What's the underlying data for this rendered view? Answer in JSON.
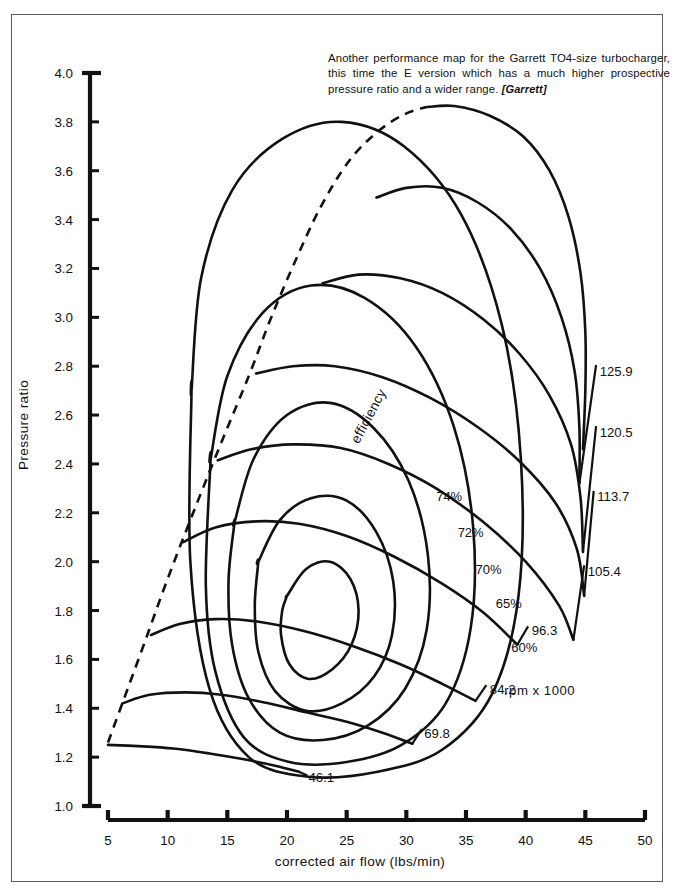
{
  "caption": {
    "text": "Another performance map for the Garrett TO4-size turbocharger, this time the E version which has a much higher prospective pressure ratio and a wider range.",
    "source": "[Garrett]"
  },
  "axes": {
    "y_title": "Pressure ratio",
    "x_title": "corrected  air  flow   (lbs/min)",
    "y_ticks": [
      "4.0",
      "3.8",
      "3.6",
      "3.4",
      "3.2",
      "3.0",
      "2.8",
      "2.6",
      "2.4",
      "2.2",
      "2.0",
      "1.8",
      "1.6",
      "1.4",
      "1.2",
      "1.0"
    ],
    "x_ticks": [
      "5",
      "10",
      "15",
      "20",
      "25",
      "30",
      "35",
      "40",
      "45",
      "50"
    ]
  },
  "notes": {
    "rpm_note": "rpm  x  1000",
    "efficiency_word": "efficiency"
  },
  "chart_data": {
    "type": "line",
    "xlabel": "corrected air flow (lbs/min)",
    "ylabel": "Pressure ratio",
    "xlim": [
      5,
      50
    ],
    "ylim": [
      1.0,
      4.0
    ],
    "xtick_values": [
      5,
      10,
      15,
      20,
      25,
      30,
      35,
      40,
      45,
      50
    ],
    "ytick_values": [
      1.0,
      1.2,
      1.4,
      1.6,
      1.8,
      2.0,
      2.2,
      2.4,
      2.6,
      2.8,
      3.0,
      3.2,
      3.4,
      3.6,
      3.8,
      4.0
    ],
    "grid": false,
    "legend": "none",
    "units": {
      "speed": "rpm x 1000",
      "flow": "lbs/min"
    },
    "surge_line": {
      "name": "surge line",
      "style": "dashed",
      "points": [
        [
          5.0,
          1.26
        ],
        [
          6.2,
          1.42
        ],
        [
          8.0,
          1.66
        ],
        [
          10.0,
          1.93
        ],
        [
          12.3,
          2.22
        ],
        [
          14.6,
          2.5
        ],
        [
          16.8,
          2.76
        ],
        [
          18.6,
          2.99
        ],
        [
          20.6,
          3.22
        ],
        [
          22.8,
          3.45
        ],
        [
          25.2,
          3.64
        ],
        [
          27.6,
          3.76
        ],
        [
          29.8,
          3.83
        ],
        [
          31.6,
          3.86
        ]
      ]
    },
    "speed_lines": [
      {
        "label": "46.1",
        "value": 46.1,
        "points": [
          [
            5.0,
            1.25
          ],
          [
            7.5,
            1.245
          ],
          [
            10.5,
            1.235
          ],
          [
            13.5,
            1.215
          ],
          [
            16.5,
            1.19
          ],
          [
            19.0,
            1.165
          ],
          [
            21.0,
            1.14
          ]
        ],
        "label_pos": [
          21.8,
          1.12
        ]
      },
      {
        "label": "69.8",
        "value": 69.8,
        "points": [
          [
            6.2,
            1.42
          ],
          [
            8.5,
            1.455
          ],
          [
            11.5,
            1.465
          ],
          [
            14.5,
            1.455
          ],
          [
            18.0,
            1.425
          ],
          [
            21.5,
            1.385
          ],
          [
            25.0,
            1.345
          ],
          [
            28.0,
            1.3
          ],
          [
            30.5,
            1.255
          ]
        ],
        "label_pos": [
          31.5,
          1.3
        ]
      },
      {
        "label": "84.2",
        "value": 84.2,
        "points": [
          [
            8.6,
            1.7
          ],
          [
            11.0,
            1.745
          ],
          [
            14.0,
            1.765
          ],
          [
            17.5,
            1.755
          ],
          [
            21.5,
            1.715
          ],
          [
            25.5,
            1.655
          ],
          [
            29.5,
            1.58
          ],
          [
            33.0,
            1.5
          ],
          [
            35.8,
            1.43
          ]
        ],
        "label_pos": [
          37.0,
          1.48
        ]
      },
      {
        "label": "96.3",
        "value": 96.3,
        "points": [
          [
            11.3,
            2.08
          ],
          [
            14.0,
            2.14
          ],
          [
            17.5,
            2.165
          ],
          [
            21.0,
            2.155
          ],
          [
            25.0,
            2.105
          ],
          [
            29.0,
            2.02
          ],
          [
            33.0,
            1.91
          ],
          [
            36.5,
            1.79
          ],
          [
            39.3,
            1.66
          ]
        ],
        "label_pos": [
          40.5,
          1.72
        ]
      },
      {
        "label": "105.4",
        "value": 105.4,
        "points": [
          [
            14.2,
            2.415
          ],
          [
            17.0,
            2.46
          ],
          [
            20.5,
            2.48
          ],
          [
            24.5,
            2.465
          ],
          [
            28.5,
            2.4
          ],
          [
            32.5,
            2.3
          ],
          [
            36.5,
            2.16
          ],
          [
            40.0,
            2.0
          ],
          [
            42.8,
            1.82
          ],
          [
            44.0,
            1.68
          ]
        ],
        "label_pos": [
          45.2,
          1.96
        ]
      },
      {
        "label": "113.7",
        "value": 113.7,
        "points": [
          [
            17.4,
            2.77
          ],
          [
            20.5,
            2.8
          ],
          [
            24.0,
            2.8
          ],
          [
            28.0,
            2.755
          ],
          [
            32.0,
            2.67
          ],
          [
            36.0,
            2.55
          ],
          [
            39.5,
            2.41
          ],
          [
            42.5,
            2.24
          ],
          [
            44.3,
            2.05
          ],
          [
            44.9,
            1.86
          ]
        ],
        "label_pos": [
          46.0,
          2.27
        ]
      },
      {
        "label": "120.5",
        "value": 120.5,
        "points": [
          [
            23.0,
            3.14
          ],
          [
            26.0,
            3.175
          ],
          [
            29.5,
            3.16
          ],
          [
            33.0,
            3.1
          ],
          [
            36.5,
            2.99
          ],
          [
            39.5,
            2.85
          ],
          [
            42.0,
            2.68
          ],
          [
            43.8,
            2.48
          ],
          [
            44.6,
            2.26
          ],
          [
            44.8,
            2.04
          ]
        ],
        "label_pos": [
          46.2,
          2.53
        ]
      },
      {
        "label": "125.9",
        "value": 125.9,
        "points": [
          [
            27.5,
            3.49
          ],
          [
            30.0,
            3.53
          ],
          [
            33.0,
            3.53
          ],
          [
            36.0,
            3.47
          ],
          [
            38.8,
            3.36
          ],
          [
            41.2,
            3.2
          ],
          [
            43.0,
            3.0
          ],
          [
            44.1,
            2.78
          ],
          [
            44.5,
            2.55
          ],
          [
            44.5,
            2.32
          ]
        ],
        "label_pos": [
          46.2,
          2.78
        ]
      },
      {
        "label": "max",
        "value": 130.0,
        "show_label": false,
        "points": [
          [
            31.6,
            3.86
          ],
          [
            34.0,
            3.865
          ],
          [
            37.0,
            3.825
          ],
          [
            39.8,
            3.74
          ],
          [
            42.0,
            3.6
          ],
          [
            43.6,
            3.41
          ],
          [
            44.6,
            3.18
          ],
          [
            45.0,
            2.94
          ],
          [
            45.0,
            2.7
          ],
          [
            44.8,
            2.46
          ]
        ],
        "label_pos": [
          46.5,
          3.1
        ]
      }
    ],
    "efficiency_islands": [
      {
        "label": "74%",
        "value": 74,
        "points": [
          [
            20.0,
            1.86
          ],
          [
            21.6,
            1.97
          ],
          [
            23.6,
            2.0
          ],
          [
            25.3,
            1.93
          ],
          [
            26.0,
            1.8
          ],
          [
            25.4,
            1.66
          ],
          [
            23.8,
            1.56
          ],
          [
            21.8,
            1.52
          ],
          [
            20.2,
            1.58
          ],
          [
            19.5,
            1.7
          ],
          [
            19.6,
            1.8
          ],
          [
            20.0,
            1.86
          ]
        ],
        "label_pos": [
          32.5,
          2.27
        ]
      },
      {
        "label": "72%",
        "value": 72,
        "points": [
          [
            17.6,
            2.0
          ],
          [
            19.4,
            2.17
          ],
          [
            22.0,
            2.26
          ],
          [
            25.0,
            2.25
          ],
          [
            27.5,
            2.12
          ],
          [
            28.9,
            1.92
          ],
          [
            28.8,
            1.7
          ],
          [
            27.3,
            1.53
          ],
          [
            24.6,
            1.42
          ],
          [
            21.6,
            1.39
          ],
          [
            19.0,
            1.47
          ],
          [
            17.6,
            1.63
          ],
          [
            17.3,
            1.82
          ],
          [
            17.6,
            2.0
          ]
        ],
        "label_pos": [
          34.3,
          2.12
        ]
      },
      {
        "label": "70%",
        "value": 70,
        "points": [
          [
            15.6,
            2.16
          ],
          [
            17.2,
            2.42
          ],
          [
            20.0,
            2.6
          ],
          [
            23.6,
            2.65
          ],
          [
            27.2,
            2.55
          ],
          [
            30.2,
            2.33
          ],
          [
            31.8,
            2.03
          ],
          [
            31.7,
            1.72
          ],
          [
            29.9,
            1.48
          ],
          [
            26.8,
            1.33
          ],
          [
            23.0,
            1.27
          ],
          [
            19.4,
            1.3
          ],
          [
            16.8,
            1.44
          ],
          [
            15.4,
            1.66
          ],
          [
            15.1,
            1.92
          ],
          [
            15.6,
            2.16
          ]
        ],
        "label_pos": [
          35.8,
          1.97
        ]
      },
      {
        "label": "65%",
        "value": 65,
        "points": [
          [
            13.6,
            2.42
          ],
          [
            15.0,
            2.76
          ],
          [
            18.0,
            3.02
          ],
          [
            22.0,
            3.13
          ],
          [
            26.5,
            3.08
          ],
          [
            30.8,
            2.88
          ],
          [
            34.0,
            2.55
          ],
          [
            35.6,
            2.14
          ],
          [
            35.4,
            1.73
          ],
          [
            33.3,
            1.42
          ],
          [
            29.6,
            1.25
          ],
          [
            25.0,
            1.18
          ],
          [
            20.2,
            1.18
          ],
          [
            16.4,
            1.28
          ],
          [
            14.0,
            1.55
          ],
          [
            13.2,
            1.9
          ],
          [
            13.6,
            2.42
          ]
        ],
        "label_pos": [
          37.5,
          1.83
        ]
      },
      {
        "label": "60%",
        "value": 60,
        "points": [
          [
            12.0,
            2.7
          ],
          [
            12.8,
            3.16
          ],
          [
            15.4,
            3.52
          ],
          [
            19.6,
            3.73
          ],
          [
            24.6,
            3.8
          ],
          [
            29.8,
            3.7
          ],
          [
            34.6,
            3.42
          ],
          [
            38.0,
            2.97
          ],
          [
            39.6,
            2.42
          ],
          [
            39.4,
            1.86
          ],
          [
            37.2,
            1.46
          ],
          [
            33.0,
            1.23
          ],
          [
            27.6,
            1.14
          ],
          [
            21.8,
            1.12
          ],
          [
            16.8,
            1.2
          ],
          [
            13.5,
            1.48
          ],
          [
            11.9,
            2.0
          ],
          [
            12.0,
            2.7
          ]
        ],
        "label_pos": [
          38.8,
          1.65
        ]
      }
    ],
    "speed_label_leaders": [
      {
        "from": [
          21.0,
          1.14
        ],
        "to": [
          21.7,
          1.125
        ]
      },
      {
        "from": [
          30.5,
          1.255
        ],
        "to": [
          31.3,
          1.315
        ]
      },
      {
        "from": [
          35.8,
          1.43
        ],
        "to": [
          36.7,
          1.495
        ]
      },
      {
        "from": [
          39.3,
          1.66
        ],
        "to": [
          40.2,
          1.735
        ]
      },
      {
        "from": [
          44.0,
          1.68
        ],
        "to": [
          44.9,
          1.985
        ]
      },
      {
        "from": [
          44.9,
          1.86
        ],
        "to": [
          45.7,
          2.29
        ]
      },
      {
        "from": [
          44.8,
          2.04
        ],
        "to": [
          45.9,
          2.555
        ]
      },
      {
        "from": [
          44.5,
          2.32
        ],
        "to": [
          45.9,
          2.805
        ]
      }
    ]
  }
}
